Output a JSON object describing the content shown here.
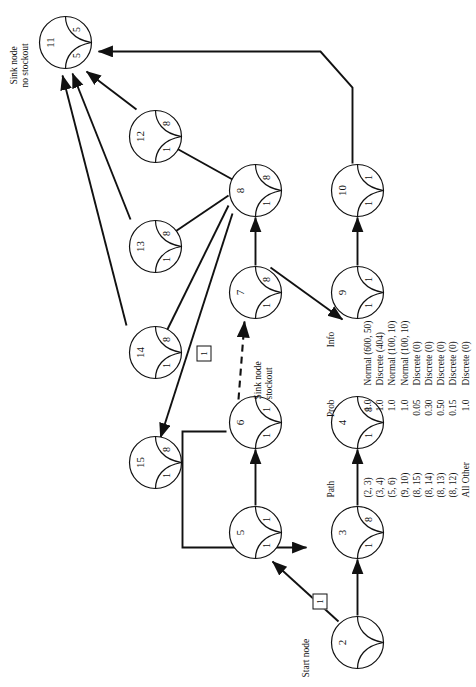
{
  "figure": {
    "type": "network-flow-diagram",
    "orientation": "rotated-90-ccw"
  },
  "nodes": [
    {
      "id": "2",
      "left": "",
      "right": "",
      "x": 18,
      "y": 330,
      "label": "Start node",
      "label_x": 10,
      "label_y": 300,
      "label_align": "right"
    },
    {
      "id": "3",
      "left": "1",
      "right": "8",
      "x": 128,
      "y": 330,
      "label": "",
      "label_x": 0,
      "label_y": 0,
      "label_align": "left"
    },
    {
      "id": "4",
      "left": "1",
      "right": "8",
      "x": 238,
      "y": 330,
      "label": "",
      "label_x": 0,
      "label_y": 0,
      "label_align": "left"
    },
    {
      "id": "5",
      "left": "1",
      "right": "1",
      "x": 128,
      "y": 228,
      "label": "",
      "label_x": 0,
      "label_y": 0,
      "label_align": "left"
    },
    {
      "id": "6",
      "left": "1",
      "right": "1",
      "x": 238,
      "y": 228,
      "label": "Sink node\nstockout",
      "label_x": 288,
      "label_y": 252,
      "label_align": "left"
    },
    {
      "id": "7",
      "left": "1",
      "right": "8",
      "x": 368,
      "y": 228,
      "label": "",
      "label_x": 0,
      "label_y": 0,
      "label_align": "left"
    },
    {
      "id": "8",
      "left": "1",
      "right": "8",
      "x": 470,
      "y": 228,
      "label": "",
      "label_x": 0,
      "label_y": 0,
      "label_align": "left"
    },
    {
      "id": "9",
      "left": "1",
      "right": "1",
      "x": 368,
      "y": 330,
      "label": "",
      "label_x": 0,
      "label_y": 0,
      "label_align": "left"
    },
    {
      "id": "10",
      "left": "1",
      "right": "1",
      "x": 470,
      "y": 330,
      "label": "",
      "label_x": 0,
      "label_y": 0,
      "label_align": "left"
    },
    {
      "id": "11",
      "left": "5",
      "right": "5",
      "x": 618,
      "y": 38,
      "label": "Sink node\nno stockout",
      "label_x": 600,
      "label_y": 8,
      "label_align": "center"
    },
    {
      "id": "12",
      "left": "1",
      "right": "8",
      "x": 524,
      "y": 128,
      "label": "",
      "label_x": 0,
      "label_y": 0,
      "label_align": "left"
    },
    {
      "id": "13",
      "left": "1",
      "right": "8",
      "x": 414,
      "y": 128,
      "label": "",
      "label_x": 0,
      "label_y": 0,
      "label_align": "left"
    },
    {
      "id": "14",
      "left": "1",
      "right": "8",
      "x": 308,
      "y": 128,
      "label": "",
      "label_x": 0,
      "label_y": 0,
      "label_align": "left"
    },
    {
      "id": "15",
      "left": "1",
      "right": "8",
      "x": 198,
      "y": 128,
      "label": "",
      "label_x": 0,
      "label_y": 0,
      "label_align": "left"
    }
  ],
  "edge_boxes": [
    {
      "value": "1",
      "x": 78,
      "y": 312
    },
    {
      "value": "1",
      "x": 326,
      "y": 196
    }
  ],
  "table": {
    "headers": {
      "path": "Path",
      "prob": "Prob",
      "info": "Info"
    },
    "rows": [
      {
        "path": "(2, 3)",
        "prob": "1.0",
        "info": "Normal (600, 50)"
      },
      {
        "path": "(3, 4)",
        "prob": "1.0",
        "info": "Discrete (404)"
      },
      {
        "path": "(5, 6)",
        "prob": "1.0",
        "info": "Normal (100, 10)"
      },
      {
        "path": "(9, 10)",
        "prob": "1.0",
        "info": "Normal (100, 10)"
      },
      {
        "path": "(8, 15)",
        "prob": "0.05",
        "info": "Discrete (0)"
      },
      {
        "path": "(8, 14)",
        "prob": "0.30",
        "info": "Discrete (0)"
      },
      {
        "path": "(8, 13)",
        "prob": "0.50",
        "info": "Discrete (0)"
      },
      {
        "path": "(8, 12)",
        "prob": "0.15",
        "info": "Discrete (0)"
      },
      {
        "path": "All Other",
        "prob": "1.0",
        "info": "Discrete (0)"
      }
    ]
  },
  "colors": {
    "ink": "#111111",
    "paper": "#ffffff"
  }
}
